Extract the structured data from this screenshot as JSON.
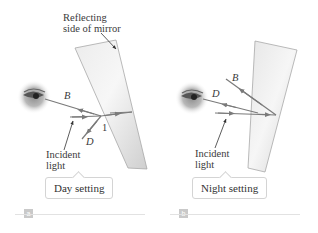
{
  "figure": {
    "colors": {
      "ray": "#7a7a7a",
      "mirror_light": "#f2f2f2",
      "mirror_dark": "#cfcfcf",
      "text": "#3a3a3a",
      "tag_bg": "#c9c9c9"
    },
    "panels": [
      {
        "id": "a",
        "tag": "a",
        "caption": "Day setting",
        "labels": {
          "mirror_annotation": "Reflecting\nside of mirror",
          "mirror_annotation_line1": "Reflecting",
          "mirror_annotation_line2": "side of mirror",
          "ray_B": "B",
          "ray_D": "D",
          "ray_1": "1",
          "incident_line1": "Incident",
          "incident_line2": "light"
        },
        "icons": [
          "eye-icon",
          "wedge-mirror"
        ]
      },
      {
        "id": "b",
        "tag": "b",
        "caption": "Night setting",
        "labels": {
          "ray_B": "B",
          "ray_D": "D",
          "incident_line1": "Incident",
          "incident_line2": "light"
        },
        "icons": [
          "eye-icon",
          "wedge-mirror"
        ]
      }
    ]
  }
}
